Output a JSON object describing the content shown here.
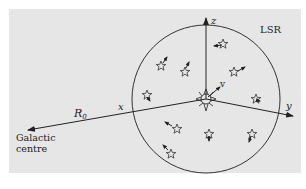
{
  "diagram": {
    "frame_label": "LSR",
    "axes": {
      "x": "x",
      "y": "y",
      "z": "z"
    },
    "velocity_label": "v",
    "distance_label": "R",
    "distance_subscript": "0",
    "galactic_centre": {
      "line1": "Galactic",
      "line2": "centre"
    },
    "colors": {
      "background": "#e6e6e6",
      "ink": "#222222"
    }
  }
}
